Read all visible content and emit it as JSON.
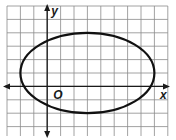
{
  "graph": {
    "type": "ellipse-on-grid",
    "axis_labels": {
      "x": "x",
      "y": "y",
      "origin": "O"
    },
    "grid": {
      "columns": 12,
      "rows": 10,
      "cell_px": 13.4,
      "x_units_range": [
        -3,
        9
      ],
      "y_units_range": [
        -4,
        6
      ]
    },
    "ellipse": {
      "center": [
        3,
        1
      ],
      "semi_axis_x": 5,
      "semi_axis_y": 3,
      "equation": "(x-3)^2/25 + (y-1)^2/9 = 1"
    },
    "colors": {
      "grid": "#8a8a8a",
      "axes": "#1a1a1a",
      "curve": "#111111",
      "background": "#ffffff"
    }
  }
}
